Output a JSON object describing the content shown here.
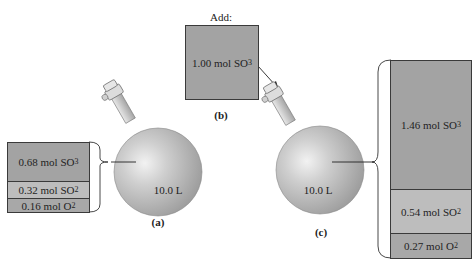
{
  "panel_a": {
    "label": "(a)",
    "flask_volume": "10.0 L",
    "components": [
      {
        "amount": "0.68 mol SO",
        "subscript": "3"
      },
      {
        "amount": "0.32 mol SO",
        "subscript": "2"
      },
      {
        "amount": "0.16 mol O",
        "subscript": "2"
      }
    ]
  },
  "panel_b": {
    "label": "(b)",
    "heading": "Add:",
    "component": {
      "amount": "1.00 mol SO",
      "subscript": "3"
    }
  },
  "panel_c": {
    "label": "(c)",
    "flask_volume": "10.0 L",
    "components": [
      {
        "amount": "1.46 mol SO",
        "subscript": "3"
      },
      {
        "amount": "0.54 mol SO",
        "subscript": "2"
      },
      {
        "amount": "0.27 mol O",
        "subscript": "2"
      }
    ]
  },
  "colors": {
    "box_fill_dark": "#a3a3a3",
    "box_fill_light": "#bdbdbd",
    "flask_fill": "#b8b8b8",
    "outline": "#3a3a3a"
  }
}
